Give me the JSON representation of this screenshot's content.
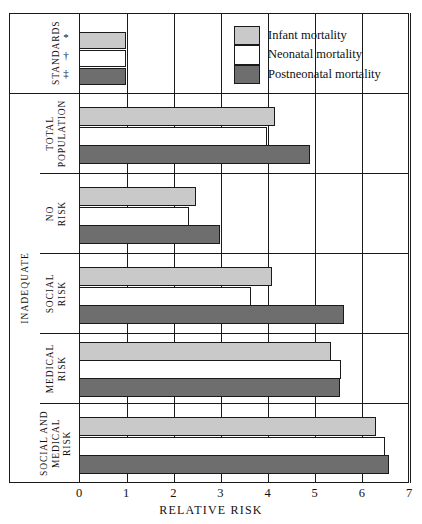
{
  "chart_data": {
    "type": "bar",
    "orientation": "horizontal",
    "title": "",
    "xlabel": "RELATIVE RISK",
    "ylabel": "",
    "xlim": [
      0,
      7
    ],
    "xticks": [
      "0",
      "1",
      "2",
      "3",
      "4",
      "5",
      "6",
      "7"
    ],
    "grid": "vertical",
    "legend_position": "top-right",
    "series": [
      {
        "name": "Infant mortality",
        "color": "#c9c9c9",
        "values": [
          1.0,
          4.15,
          2.48,
          4.1,
          5.35,
          6.3
        ]
      },
      {
        "name": "Neonatal mortality",
        "color": "#ffffff",
        "values": [
          1.0,
          3.98,
          2.34,
          3.65,
          5.55,
          6.5
        ]
      },
      {
        "name": "Postneonatal mortality",
        "color": "#6e6e6e",
        "values": [
          1.0,
          4.9,
          2.99,
          5.62,
          5.54,
          6.57
        ]
      }
    ],
    "categories": [
      "STANDARDS",
      "TOTAL\nPOPULATION",
      "NO\nRISK",
      "SOCIAL\nRISK",
      "MEDICAL\nRISK",
      "SOCIAL AND\nMEDICAL\nRISK"
    ],
    "group_label": "INADEQUATE",
    "standards_markers": [
      "*",
      "†",
      "‡"
    ]
  },
  "axis": {
    "title": "RELATIVE RISK",
    "ticks": [
      "0",
      "1",
      "2",
      "3",
      "4",
      "5",
      "6",
      "7"
    ]
  },
  "legend": {
    "items": [
      {
        "label": "Infant mortality"
      },
      {
        "label": "Neonatal mortality"
      },
      {
        "label": "Postneonatal mortality"
      }
    ]
  },
  "labels": {
    "standards": "STANDARDS",
    "total_population": "TOTAL\nPOPULATION",
    "no_risk": "NO\nRISK",
    "social_risk": "SOCIAL\nRISK",
    "medical_risk": "MEDICAL\nRISK",
    "social_medical_risk": "SOCIAL AND\nMEDICAL\nRISK",
    "inadequate": "INADEQUATE",
    "marker_star": "*",
    "marker_dagger": "†",
    "marker_ddagger": "‡"
  }
}
